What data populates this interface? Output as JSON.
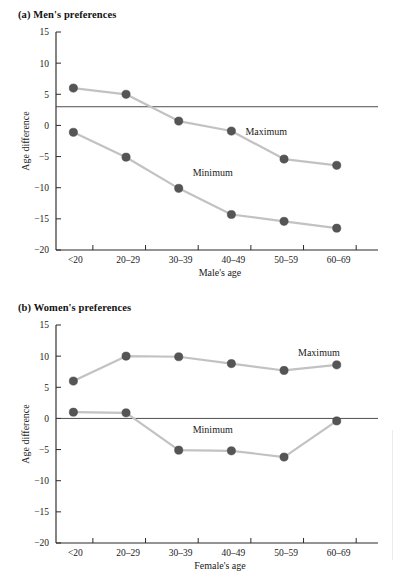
{
  "figure": {
    "background": "#ffffff",
    "marker_color": "#555555",
    "line_color": "#c2c2c2",
    "axis_color": "#2b2b2b"
  },
  "panels": [
    {
      "id": "a",
      "title": "(a) Men's preferences",
      "chart_data": {
        "type": "line",
        "title": "(a) Men's preferences",
        "xlabel": "Male's age",
        "ylabel": "Age difference",
        "categories": [
          "<20",
          "20–29",
          "30–39",
          "40–49",
          "50–59",
          "60–69"
        ],
        "yticks": [
          15,
          10,
          5,
          0,
          -5,
          -10,
          -15,
          -20
        ],
        "ylim": [
          -20,
          15
        ],
        "grid": false,
        "legend": "inline-annotation",
        "reference_line": 3,
        "series": [
          {
            "name": "Maximum",
            "values": [
              6.0,
              5.0,
              0.7,
              -0.9,
              -5.4,
              -6.4
            ]
          },
          {
            "name": "Minimum",
            "values": [
              -1.1,
              -5.1,
              -10.1,
              -14.3,
              -15.4,
              -16.5
            ]
          }
        ],
        "annotations": [
          {
            "text": "Maximum",
            "x_category": "40–49",
            "y": -1.0
          },
          {
            "text": "Minimum",
            "x_category": "30–39",
            "y": -7.6
          }
        ]
      }
    },
    {
      "id": "b",
      "title": "(b) Women's preferences",
      "chart_data": {
        "type": "line",
        "title": "(b) Women's preferences",
        "xlabel": "Female's age",
        "ylabel": "Age difference",
        "categories": [
          "<20",
          "20–29",
          "30–39",
          "40–49",
          "50–59",
          "60–69"
        ],
        "yticks": [
          15,
          10,
          5,
          0,
          -5,
          -10,
          -15,
          -20
        ],
        "ylim": [
          -20,
          15
        ],
        "grid": false,
        "legend": "inline-annotation",
        "reference_line": 0,
        "series": [
          {
            "name": "Maximum",
            "values": [
              6.0,
              10.0,
              9.9,
              8.8,
              7.7,
              8.6
            ]
          },
          {
            "name": "Minimum",
            "values": [
              1.0,
              0.9,
              -5.1,
              -5.2,
              -6.2,
              -0.4
            ]
          }
        ],
        "annotations": [
          {
            "text": "Maximum",
            "x_category": "50–59",
            "y": 10.6
          },
          {
            "text": "Minimum",
            "x_category": "30–39",
            "y": -1.7
          }
        ]
      }
    }
  ]
}
